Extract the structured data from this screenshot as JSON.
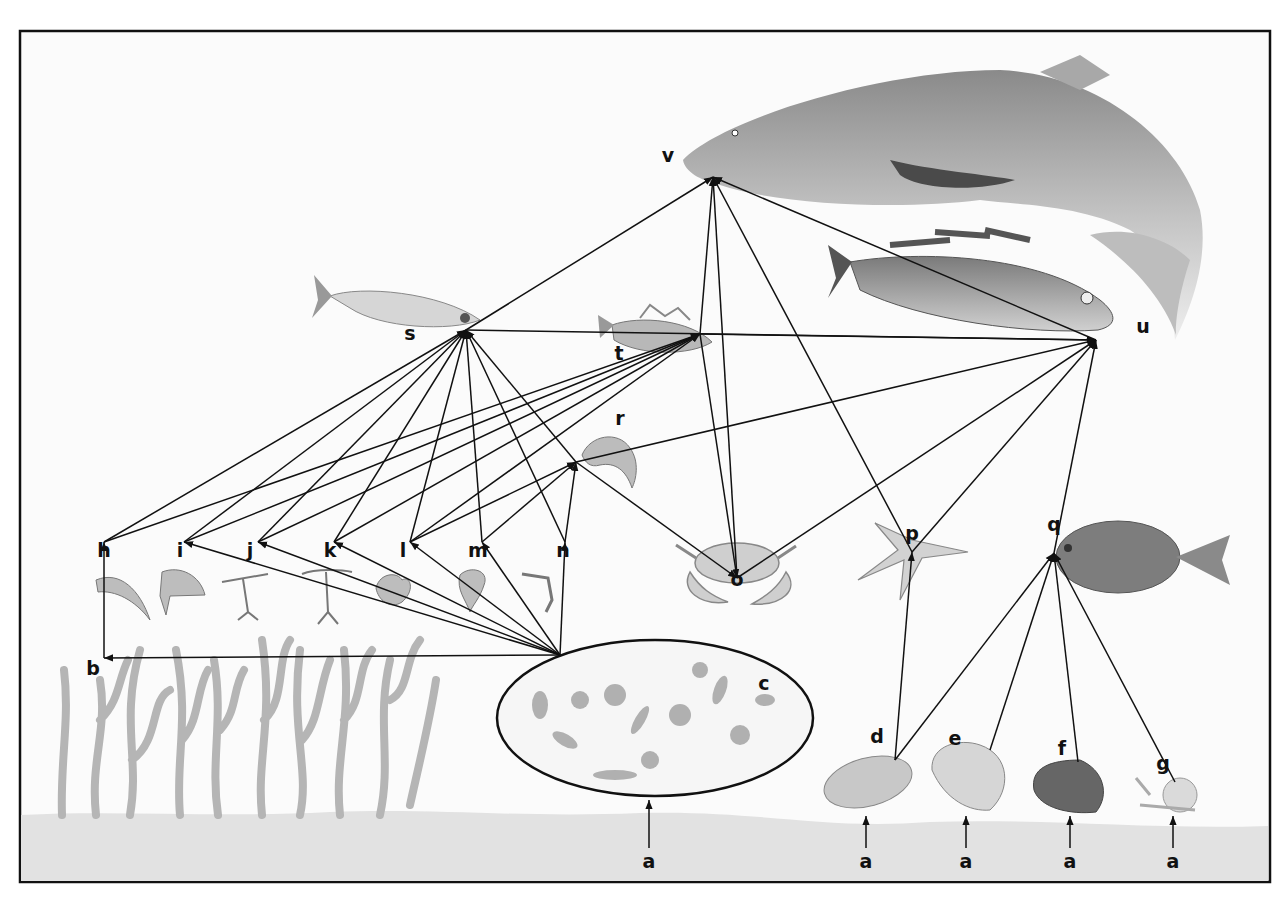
{
  "diagram": {
    "type": "marine food web",
    "frame": {
      "x": 20,
      "y": 30,
      "width": 1250,
      "height": 852,
      "border_color": "#111111",
      "background": "#fbfbfb"
    },
    "seabed_color": "#e2e2e2",
    "nodes": [
      {
        "id": "a1",
        "label": "a",
        "desc": "nutrients / seabed",
        "x": 649,
        "y": 868
      },
      {
        "id": "a2",
        "label": "a",
        "desc": "nutrients / seabed",
        "x": 866,
        "y": 868
      },
      {
        "id": "a3",
        "label": "a",
        "desc": "nutrients / seabed",
        "x": 966,
        "y": 868
      },
      {
        "id": "a4",
        "label": "a",
        "desc": "nutrients / seabed",
        "x": 1070,
        "y": 868
      },
      {
        "id": "a5",
        "label": "a",
        "desc": "nutrients / seabed",
        "x": 1173,
        "y": 868
      },
      {
        "id": "b",
        "label": "b",
        "desc": "seaweed",
        "x": 93,
        "y": 675
      },
      {
        "id": "c",
        "label": "c",
        "desc": "phytoplankton",
        "x": 764,
        "y": 690
      },
      {
        "id": "d",
        "label": "d",
        "desc": "mussel",
        "x": 877,
        "y": 743
      },
      {
        "id": "e",
        "label": "e",
        "desc": "cockle",
        "x": 955,
        "y": 745
      },
      {
        "id": "f",
        "label": "f",
        "desc": "clam",
        "x": 1062,
        "y": 755
      },
      {
        "id": "g",
        "label": "g",
        "desc": "snail",
        "x": 1163,
        "y": 770
      },
      {
        "id": "h",
        "label": "h",
        "desc": "shrimp larva",
        "x": 104,
        "y": 557
      },
      {
        "id": "i",
        "label": "i",
        "desc": "crab larva",
        "x": 180,
        "y": 557
      },
      {
        "id": "j",
        "label": "j",
        "desc": "copepod",
        "x": 250,
        "y": 557
      },
      {
        "id": "k",
        "label": "k",
        "desc": "copepod",
        "x": 330,
        "y": 557
      },
      {
        "id": "l",
        "label": "l",
        "desc": "larva",
        "x": 403,
        "y": 557
      },
      {
        "id": "m",
        "label": "m",
        "desc": "larva",
        "x": 478,
        "y": 557
      },
      {
        "id": "n",
        "label": "n",
        "desc": "small crustacean",
        "x": 563,
        "y": 557
      },
      {
        "id": "o",
        "label": "o",
        "desc": "crab",
        "x": 737,
        "y": 586
      },
      {
        "id": "p",
        "label": "p",
        "desc": "starfish",
        "x": 912,
        "y": 540
      },
      {
        "id": "q",
        "label": "q",
        "desc": "flatfish",
        "x": 1054,
        "y": 531
      },
      {
        "id": "r",
        "label": "r",
        "desc": "shrimp",
        "x": 620,
        "y": 425
      },
      {
        "id": "s",
        "label": "s",
        "desc": "herring",
        "x": 410,
        "y": 340
      },
      {
        "id": "t",
        "label": "t",
        "desc": "small fish",
        "x": 619,
        "y": 360
      },
      {
        "id": "u",
        "label": "u",
        "desc": "cod",
        "x": 1143,
        "y": 333
      },
      {
        "id": "v",
        "label": "v",
        "desc": "shark",
        "x": 668,
        "y": 162
      }
    ],
    "edges": [
      [
        "a1",
        "c"
      ],
      [
        "a2",
        "d"
      ],
      [
        "a3",
        "e"
      ],
      [
        "a4",
        "f"
      ],
      [
        "a5",
        "g"
      ],
      [
        "b",
        "h"
      ],
      [
        "c",
        "i"
      ],
      [
        "c",
        "j"
      ],
      [
        "c",
        "k"
      ],
      [
        "c",
        "l"
      ],
      [
        "c",
        "m"
      ],
      [
        "c",
        "n"
      ],
      [
        "c",
        "b"
      ],
      [
        "d",
        "p"
      ],
      [
        "d",
        "q"
      ],
      [
        "e",
        "q"
      ],
      [
        "f",
        "q"
      ],
      [
        "g",
        "q"
      ],
      [
        "h",
        "s"
      ],
      [
        "i",
        "s"
      ],
      [
        "j",
        "s"
      ],
      [
        "k",
        "s"
      ],
      [
        "l",
        "s"
      ],
      [
        "m",
        "s"
      ],
      [
        "n",
        "s"
      ],
      [
        "r",
        "s"
      ],
      [
        "h",
        "t"
      ],
      [
        "i",
        "t"
      ],
      [
        "j",
        "t"
      ],
      [
        "k",
        "t"
      ],
      [
        "l",
        "t"
      ],
      [
        "l",
        "r"
      ],
      [
        "m",
        "r"
      ],
      [
        "n",
        "r"
      ],
      [
        "r",
        "o"
      ],
      [
        "t",
        "o"
      ],
      [
        "s",
        "v"
      ],
      [
        "t",
        "v"
      ],
      [
        "o",
        "v"
      ],
      [
        "p",
        "v"
      ],
      [
        "u",
        "v"
      ],
      [
        "s",
        "u"
      ],
      [
        "t",
        "u"
      ],
      [
        "r",
        "u"
      ],
      [
        "o",
        "u"
      ],
      [
        "p",
        "u"
      ],
      [
        "q",
        "u"
      ]
    ]
  }
}
